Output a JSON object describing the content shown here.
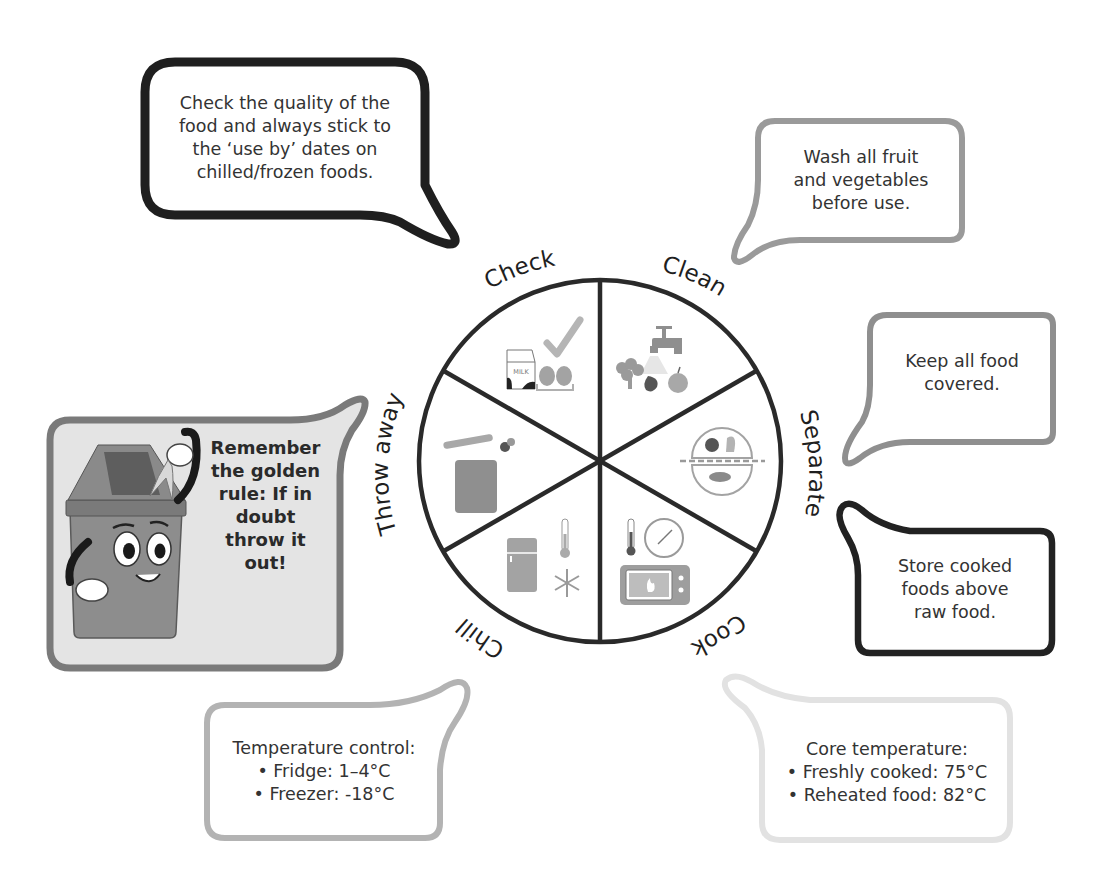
{
  "wheel": {
    "center": [
      600,
      461
    ],
    "radius": 181,
    "segments": [
      {
        "label": "Check",
        "icons": [
          "milk-carton-icon",
          "eggs-icon",
          "checkmark-icon"
        ]
      },
      {
        "label": "Clean",
        "icons": [
          "tap-icon",
          "broccoli-icon",
          "strawberry-icon",
          "apple-icon"
        ]
      },
      {
        "label": "Separate",
        "icons": [
          "separated-plate-icon"
        ]
      },
      {
        "label": "Cook",
        "icons": [
          "thermometer-icon",
          "clock-icon",
          "microwave-icon"
        ]
      },
      {
        "label": "Chill",
        "icons": [
          "fridge-icon",
          "thermometer-icon",
          "snowflake-icon"
        ]
      },
      {
        "label": "Throw away",
        "icons": [
          "bin-icon",
          "banana-icon",
          "fruit-icon"
        ]
      }
    ]
  },
  "bubbles": {
    "check": {
      "lines": [
        "Check the quality of the",
        "food and always stick to",
        "the ‘use by’ dates on",
        "chilled/frozen foods."
      ],
      "border": "#1f1f1f"
    },
    "clean": {
      "lines": [
        "Wash all fruit",
        "and vegetables",
        "before use."
      ],
      "border": "#9a9a9a"
    },
    "separate_cover": {
      "lines": [
        "Keep all food",
        "covered."
      ],
      "border": "#9a9a9a"
    },
    "separate_store": {
      "lines": [
        "Store cooked",
        "foods above",
        "raw food."
      ],
      "border": "#222222"
    },
    "cook": {
      "lines": [
        "Core temperature:",
        "• Freshly cooked: 75°C",
        "• Reheated food: 82°C"
      ],
      "border": "#e2e2e2"
    },
    "chill": {
      "lines": [
        "Temperature control:",
        "• Fridge: 1–4°C",
        "• Freezer: -18°C"
      ],
      "border": "#b3b3b3"
    },
    "throw_away": {
      "lines": [
        "Remember",
        "the golden",
        "rule: If in",
        "doubt",
        "throw it",
        "out!"
      ],
      "border": "#7a7a7a",
      "fill": "#e4e4e4"
    }
  },
  "colors": {
    "wheel_stroke": "#2a2a2a",
    "icon_gray": "#9e9e9e",
    "icon_dark": "#555555",
    "icon_light": "#cfcfcf"
  }
}
